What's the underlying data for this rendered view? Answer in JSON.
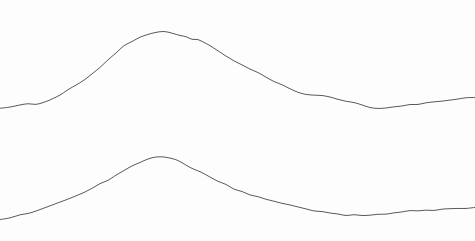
{
  "figure": {
    "title": "",
    "subtitle": "",
    "width": 475,
    "height": 241,
    "background_color": "#fdfdfd"
  },
  "chart_data": {
    "type": "line",
    "title": "",
    "subtitle": "",
    "xlabel": "",
    "ylabel": "",
    "xlim": [
      0,
      475
    ],
    "ylim": [
      241,
      0
    ],
    "grid": false,
    "axes_visible": false,
    "tick_labels_x": [],
    "tick_labels_y": [],
    "legend": {
      "visible": false,
      "position": "none",
      "entries": []
    },
    "annotations": [],
    "series": [
      {
        "name": "upper-profile",
        "color": "#5a5a5a",
        "line_width": 1.0,
        "style": "solid",
        "peak": {
          "x": 152,
          "y": 32
        },
        "x": [
          0,
          10,
          20,
          28,
          36,
          44,
          52,
          60,
          66,
          70,
          76,
          84,
          92,
          100,
          108,
          116,
          124,
          132,
          140,
          148,
          156,
          164,
          172,
          180,
          186,
          192,
          198,
          204,
          210,
          218,
          226,
          234,
          242,
          250,
          258,
          266,
          274,
          282,
          290,
          298,
          306,
          314,
          322,
          330,
          338,
          346,
          354,
          362,
          370,
          378,
          386,
          394,
          402,
          410,
          418,
          426,
          434,
          442,
          450,
          458,
          466,
          475
        ],
        "y": [
          108,
          107,
          105,
          104,
          104,
          102,
          99,
          95,
          91,
          89,
          85,
          80,
          74,
          67,
          60,
          53,
          46,
          41,
          37,
          34,
          32,
          32,
          33,
          35,
          37,
          39,
          40,
          42,
          46,
          51,
          56,
          61,
          65,
          69,
          73,
          77,
          81,
          85,
          89,
          92,
          94,
          95,
          96,
          97,
          99,
          101,
          103,
          105,
          107,
          108,
          108,
          107,
          106,
          105,
          104,
          103,
          102,
          101,
          100,
          99,
          98,
          97
        ]
      },
      {
        "name": "lower-profile",
        "color": "#5a5a5a",
        "line_width": 1.0,
        "style": "solid",
        "peak": {
          "x": 152,
          "y": 157
        },
        "x": [
          0,
          10,
          20,
          28,
          36,
          44,
          52,
          60,
          68,
          76,
          84,
          92,
          100,
          108,
          116,
          124,
          132,
          140,
          148,
          156,
          164,
          172,
          178,
          184,
          190,
          196,
          202,
          210,
          218,
          226,
          234,
          242,
          250,
          258,
          266,
          274,
          282,
          290,
          298,
          306,
          314,
          322,
          330,
          338,
          346,
          354,
          362,
          370,
          378,
          386,
          394,
          402,
          410,
          418,
          426,
          434,
          442,
          450,
          458,
          466,
          475
        ],
        "y": [
          220,
          218,
          215,
          213,
          211,
          208,
          205,
          202,
          199,
          196,
          192,
          188,
          184,
          180,
          175,
          170,
          166,
          162,
          159,
          157,
          157,
          159,
          161,
          164,
          167,
          170,
          173,
          177,
          181,
          185,
          189,
          192,
          195,
          197,
          199,
          201,
          203,
          205,
          207,
          209,
          211,
          212,
          213,
          214,
          215,
          215,
          215,
          215,
          214,
          214,
          213,
          212,
          211,
          211,
          210,
          210,
          209,
          209,
          208,
          208,
          207
        ]
      }
    ]
  }
}
